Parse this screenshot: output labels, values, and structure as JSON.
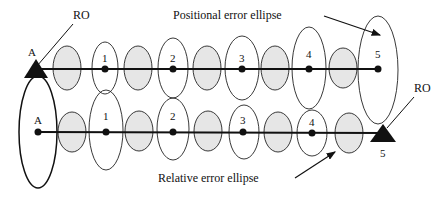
{
  "diagram": {
    "title_top": "Positional error ellipse",
    "title_bottom": "Relative error ellipse",
    "reference_label_top": "RO",
    "reference_label_bottom": "RO",
    "top_row": {
      "start_label": "A",
      "points": [
        "1",
        "2",
        "3",
        "4",
        "5"
      ]
    },
    "bottom_row": {
      "start_label": "A",
      "points": [
        "1",
        "2",
        "3",
        "4"
      ],
      "end_label": "5"
    },
    "colors": {
      "stroke": "#111111",
      "shaded_ellipse": "#e6e6e6"
    }
  }
}
